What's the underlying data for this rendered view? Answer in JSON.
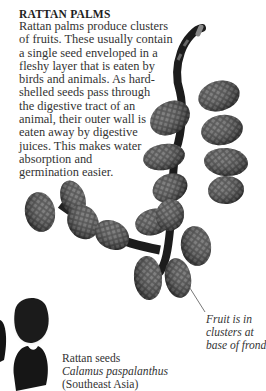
{
  "heading": "RATTAN PALMS",
  "body_lines": [
    "Rattan palms produce clusters",
    "of fruits. These usually contain",
    "a single seed enveloped in a",
    "fleshy layer that is eaten by",
    "birds and animals. As hard-",
    "shelled seeds pass through",
    "the digestive tract of an",
    "animal, their outer wall is",
    "eaten away by digestive",
    "juices. This makes water",
    "absorption and",
    "germination easier."
  ],
  "fruit_caption": [
    "Fruit is in",
    "clusters at",
    "base of frond"
  ],
  "seeds_caption": {
    "title": "Rattan seeds",
    "latin": "Calamus paspalanthus",
    "region": "(Southeast Asia)"
  }
}
